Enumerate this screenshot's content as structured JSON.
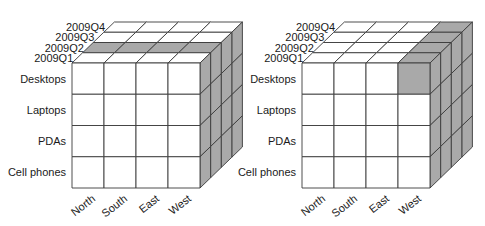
{
  "colors": {
    "face": "#ffffff",
    "shade": "#a9a9a9",
    "line": "#3a3a3a",
    "text": "#1a1a1a"
  },
  "dimensions": {
    "quarters": [
      "2009Q1",
      "2009Q2",
      "2009Q3",
      "2009Q4"
    ],
    "products": [
      "Desktops",
      "Laptops",
      "PDAs",
      "Cell phones"
    ],
    "regions": [
      "North",
      "South",
      "East",
      "West"
    ]
  },
  "cubes": [
    {
      "name": "slice-cube",
      "origin_x": 72,
      "highlight": {
        "type": "slice",
        "quarter_index": 1
      }
    },
    {
      "name": "dice-cube",
      "origin_x": 302,
      "highlight": {
        "type": "dice",
        "region_index": 3,
        "product_index": 0
      }
    }
  ]
}
